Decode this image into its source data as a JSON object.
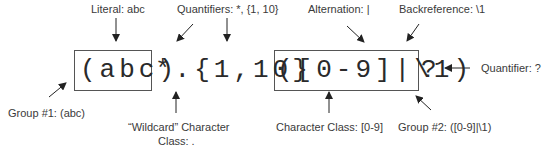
{
  "regex": {
    "group1": "(abc)",
    "middle": "*.{1,10}",
    "group2": "([0-9]|\\1)",
    "tail": "?"
  },
  "labels": {
    "literal": "Literal: abc",
    "quantifiers": "Quantifiers: *, {1, 10}",
    "alternation": "Alternation: |",
    "backreference": "Backreference: \\1",
    "quantifier": "Quantifier: ?",
    "group1": "Group #1: (abc)",
    "wildcard_line1": "“Wildcard” Character",
    "wildcard_line2": "Class: .",
    "char_class": "Character Class: [0-9]",
    "group2": "Group #2: ([0-9]|\\1)"
  },
  "colors": {
    "text": "#3a3a3a",
    "regex": "#2a2a2a",
    "border": "#555555",
    "arrow": "#222222"
  }
}
